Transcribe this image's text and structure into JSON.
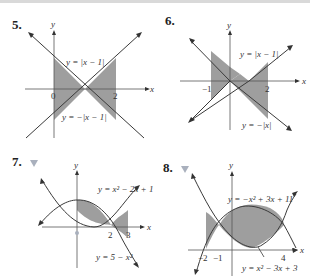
{
  "colors": {
    "shade": "#9e9e9e",
    "curve": "#3a3a3a",
    "axis": "#555555",
    "marker": "#a9b0bd"
  },
  "problems": [
    {
      "number": "5.",
      "has_marker": false,
      "axis_labels": {
        "x": "x",
        "y": "y"
      },
      "ticks": [
        "0",
        "2"
      ],
      "curves": [
        "y = |x − 1|",
        "y = −|x − 1|"
      ],
      "shaded_interval": [
        0,
        2
      ]
    },
    {
      "number": "6.",
      "has_marker": false,
      "axis_labels": {
        "x": "x",
        "y": "y"
      },
      "ticks": [
        "−1",
        "2"
      ],
      "curves": [
        "y = |x − 1|",
        "y = −|x|"
      ],
      "shaded_interval": [
        -1,
        2
      ]
    },
    {
      "number": "7.",
      "has_marker": true,
      "axis_labels": {
        "x": "x",
        "y": "y"
      },
      "ticks": [
        "0",
        "2",
        "3"
      ],
      "curves": [
        "y = x² − 2x + 1",
        "y = 5 − x²"
      ],
      "shaded_interval": [
        0,
        3
      ]
    },
    {
      "number": "8.",
      "has_marker": true,
      "axis_labels": {
        "x": "x",
        "y": "y"
      },
      "ticks": [
        "−2",
        "−1",
        "4"
      ],
      "curves": [
        "y = −x² + 3x + 11",
        "y = x² − 3x + 3"
      ],
      "shaded_interval": [
        -2,
        4
      ]
    }
  ]
}
